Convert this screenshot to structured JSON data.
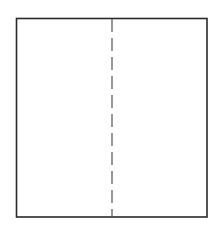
{
  "diagram": {
    "type": "folded-sheet",
    "background": "#ffffff",
    "rectangle": {
      "x": 16.5,
      "y": 18.5,
      "width": 190.5,
      "height": 198.5,
      "stroke": "#2a2a2a",
      "stroke_width": 1.6
    },
    "fold_line": {
      "x": 112,
      "y1": 19,
      "y2": 217,
      "stroke": "#555555",
      "stroke_width": 1.2,
      "dash": "13 6",
      "style": "dashed"
    }
  }
}
